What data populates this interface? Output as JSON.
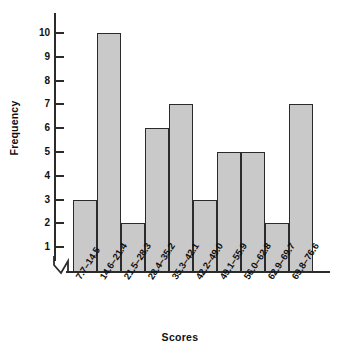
{
  "chart_data": {
    "type": "bar",
    "title": "",
    "subtitle": "",
    "xlabel": "Scores",
    "ylabel": "Frequency",
    "categories": [
      "7.7–14.5",
      "14.6–21.4",
      "21.5–28.3",
      "28.4–35.2",
      "35.3–42.1",
      "42.2–49.0",
      "49.1–55.9",
      "56.0–62.8",
      "62.9–69.7",
      "69.8–76.6"
    ],
    "values": [
      3,
      10,
      2,
      6,
      7,
      3,
      5,
      5,
      2,
      7
    ],
    "ylim": [
      0,
      10
    ],
    "ytick_labels": [
      "10",
      "9",
      "8",
      "7",
      "6",
      "5",
      "4",
      "3",
      "2",
      "1"
    ],
    "ytick_values": [
      10,
      9,
      8,
      7,
      6,
      5,
      4,
      3,
      2,
      1
    ],
    "grid": false,
    "legend": null,
    "axis_break": "y-axis-break-zigzag",
    "bar_style": {
      "fill": "#c9c9c9",
      "stroke": "#2b2b2b",
      "gap": 0
    },
    "axis_color": "#2b2b2b",
    "background": "#ffffff"
  },
  "labels": {
    "y_axis_title": "Frequency",
    "x_axis_title": "Scores"
  }
}
